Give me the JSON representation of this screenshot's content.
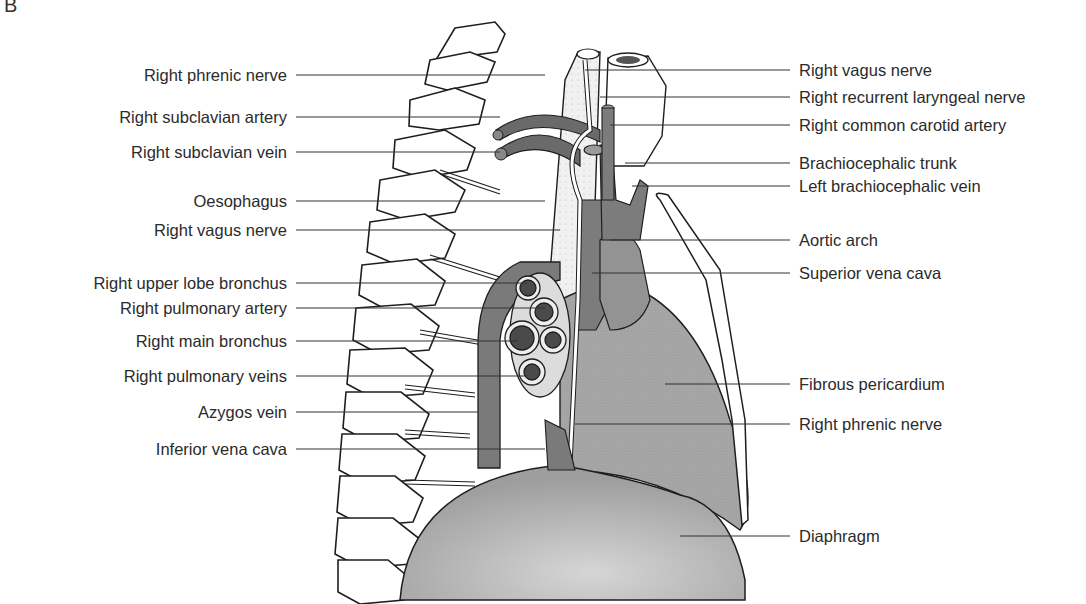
{
  "figure": {
    "panel_letter": "B",
    "colors": {
      "background": "#ffffff",
      "outline": "#1e1e1e",
      "vessel_dark": "#6e6e6e",
      "vessel_mid": "#8a8a8a",
      "pericardium": "#a9a9a9",
      "diaphragm": "#b4b4b4",
      "lumen": "#4a4a4a",
      "leader": "#333333"
    },
    "left_labels": [
      {
        "text": "Right phrenic nerve",
        "y": 75,
        "x_end": 545
      },
      {
        "text": "Right subclavian artery",
        "y": 117,
        "x_end": 500
      },
      {
        "text": "Right subclavian vein",
        "y": 152,
        "x_end": 500
      },
      {
        "text": "Oesophagus",
        "y": 201,
        "x_end": 545
      },
      {
        "text": "Right vagus nerve",
        "y": 230,
        "x_end": 560
      },
      {
        "text": "Right upper lobe bronchus",
        "y": 283,
        "x_end": 527
      },
      {
        "text": "Right pulmonary artery",
        "y": 308,
        "x_end": 545
      },
      {
        "text": "Right main bronchus",
        "y": 341,
        "x_end": 518
      },
      {
        "text": "Right pulmonary veins",
        "y": 376,
        "x_end": 527
      },
      {
        "text": "Azygos vein",
        "y": 412,
        "x_end": 478
      },
      {
        "text": "Inferior vena cava",
        "y": 449,
        "x_end": 545
      }
    ],
    "right_labels": [
      {
        "text": "Right vagus nerve",
        "y": 70,
        "x_start": 585
      },
      {
        "text": "Right recurrent laryngeal nerve",
        "y": 97,
        "x_start": 600
      },
      {
        "text": "Right common carotid artery",
        "y": 125,
        "x_start": 610
      },
      {
        "text": "Brachiocephalic trunk",
        "y": 163,
        "x_start": 625
      },
      {
        "text": "Left brachiocephalic vein",
        "y": 186,
        "x_start": 632
      },
      {
        "text": "Aortic arch",
        "y": 240,
        "x_start": 610
      },
      {
        "text": "Superior vena cava",
        "y": 273,
        "x_start": 592
      },
      {
        "text": "Fibrous pericardium",
        "y": 384,
        "x_start": 665
      },
      {
        "text": "Right phrenic nerve",
        "y": 424,
        "x_start": 575
      },
      {
        "text": "Diaphragm",
        "y": 536,
        "x_start": 680
      }
    ]
  }
}
